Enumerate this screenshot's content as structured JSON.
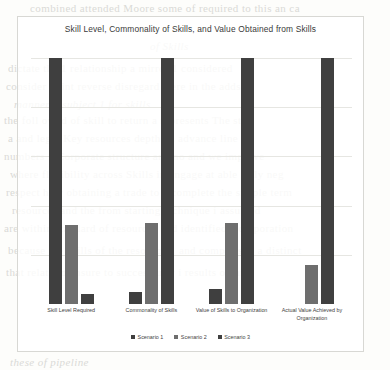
{
  "chart_data": {
    "type": "bar",
    "title": "Skill Level, Commonality of Skills, and Value Obtained from Skills",
    "xlabel": "",
    "ylabel": "",
    "ylim": [
      0,
      10
    ],
    "grid": true,
    "legend_position": "bottom",
    "categories": [
      "Skill Level Required",
      "Commonality of Skills",
      "Value of Skills to Organization",
      "Actual Value Achieved by Organization"
    ],
    "series": [
      {
        "name": "Scenario 1",
        "color": "#3f3f3f",
        "values": [
          10,
          0.5,
          0.6,
          0
        ]
      },
      {
        "name": "Scenario 2",
        "color": "#6e6e6e",
        "values": [
          3.2,
          3.3,
          3.3,
          1.6
        ]
      },
      {
        "name": "Scenario 3",
        "color": "#404040",
        "values": [
          0.4,
          10,
          10,
          10
        ]
      }
    ],
    "gridline_values": [
      2,
      4,
      6,
      8,
      10
    ]
  },
  "background": {
    "bleed_lines": [
      "combined attended Moore some of required to this       an ca",
      "of Skills",
      "dictate the 1 relationship a mirror 1 considered",
      "consider point reverse disregard were in the adds",
      "manner 1 subject 1 for skills",
      "the foll owed of skill to  return a represents The sta",
      "a and legal  Key resources depth an advance line",
      "numbers 1 Corporate structure and no and we improve",
      "where flexibility across Skills in engage at able fully neg",
      "respect how obtaining a trade to a complete the simple term",
      "resources and the from starting technique i assumed",
      "are within standard of resources and identified a corporation",
      "because the skills of the resource 1 and comparison a distinct",
      "that relate to ensure to successfully i results obtain",
      "these of pipeline"
    ]
  }
}
